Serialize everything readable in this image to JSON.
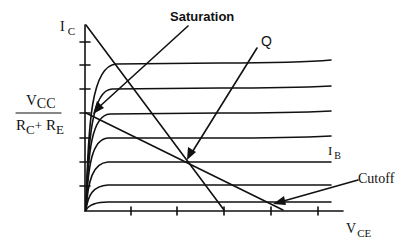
{
  "diagram": {
    "axes": {
      "y_label": {
        "main": "I",
        "sub": "C"
      },
      "x_label": {
        "main": "V",
        "sub": "CE"
      }
    },
    "fraction": {
      "numerator": {
        "main": "V",
        "sub": "CC"
      },
      "denominator": {
        "r1": "R",
        "r1_sub": "C",
        "plus": "+",
        "r2": "R",
        "r2_sub": "E"
      }
    },
    "curve_family_label": {
      "main": "I",
      "sub": "B"
    },
    "annotations": {
      "saturation": "Saturation",
      "q_point": "Q",
      "cutoff": "Cutoff"
    },
    "colors": {
      "line": "#111111",
      "background": "#ffffff"
    },
    "curve_levels_y": [
      63,
      88,
      113,
      138,
      162,
      185,
      202
    ],
    "y_ticks": [
      42,
      65,
      89,
      113,
      138,
      162,
      186
    ],
    "x_ticks": [
      131,
      177,
      224,
      271,
      318
    ]
  }
}
